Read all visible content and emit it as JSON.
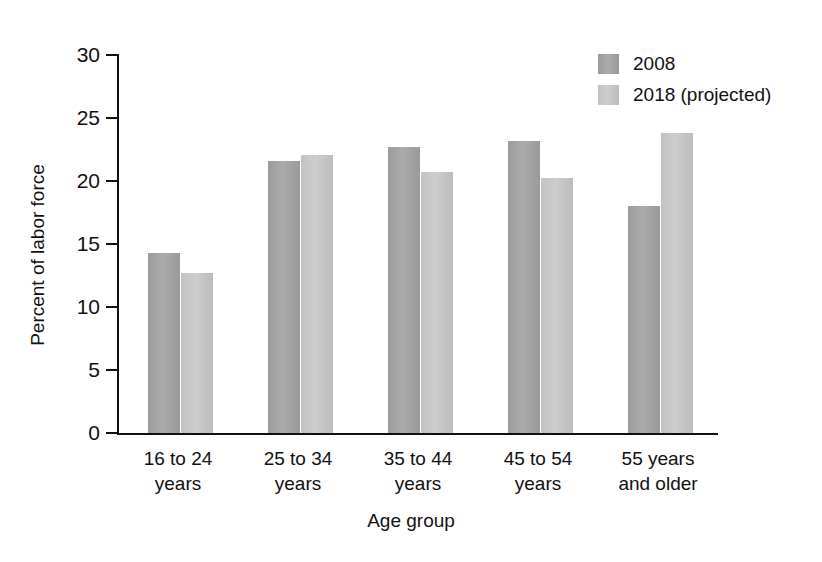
{
  "chart_data": {
    "type": "bar",
    "title": "",
    "xlabel": "Age group",
    "ylabel": "Percent of labor force",
    "categories": [
      "16 to 24\nyears",
      "25 to 34\nyears",
      "35 to 44\nyears",
      "45 to 54\nyears",
      "55 years\nand older"
    ],
    "category_lines": [
      [
        "16 to 24",
        "years"
      ],
      [
        "25 to 34",
        "years"
      ],
      [
        "35 to 44",
        "years"
      ],
      [
        "45 to 54",
        "years"
      ],
      [
        "55 years",
        "and older"
      ]
    ],
    "series": [
      {
        "name": "2008",
        "color": "#a3a3a3",
        "values": [
          14.3,
          21.6,
          22.7,
          23.2,
          18.0
        ]
      },
      {
        "name": "2018 (projected)",
        "color": "#c6c6c6",
        "values": [
          12.7,
          22.1,
          20.7,
          20.2,
          23.8
        ]
      }
    ],
    "ylim": [
      0,
      30
    ],
    "yticks": [
      0,
      5,
      10,
      15,
      20,
      25,
      30
    ],
    "ytick_labels": [
      "0",
      "5",
      "10",
      "15",
      "20",
      "25",
      "30"
    ],
    "grid": false,
    "legend_position": "top-right"
  },
  "legend": {
    "entries": [
      {
        "label": "2008"
      },
      {
        "label": "2018 (projected)"
      }
    ]
  },
  "axes": {
    "y_title": "Percent of labor force",
    "x_title": "Age group"
  }
}
